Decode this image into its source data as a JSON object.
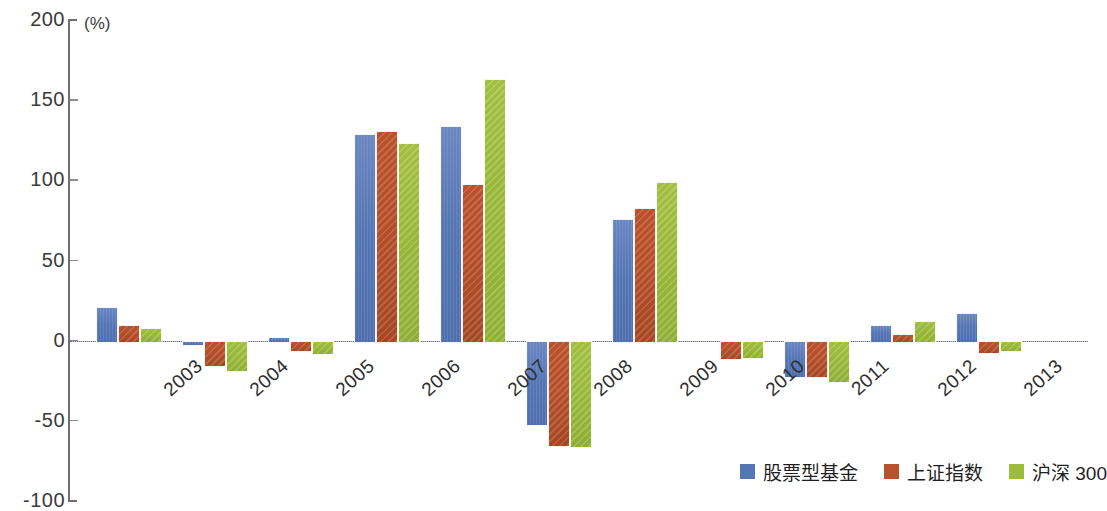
{
  "chart_data": {
    "type": "bar",
    "title": "",
    "subtitle": "",
    "xlabel": "",
    "ylabel": "",
    "unit_label": "(%)",
    "ylim": [
      -100,
      200
    ],
    "yticks": [
      200,
      150,
      100,
      50,
      0,
      -50,
      -100
    ],
    "ytick_labels": [
      "200",
      "150",
      "100",
      "50",
      "0",
      "-50",
      "-100"
    ],
    "grid": false,
    "legend_position": "bottom-right",
    "categories": [
      "2003",
      "2004",
      "2005",
      "2006",
      "2007",
      "2008",
      "2009",
      "2010",
      "2011",
      "2012",
      "2013"
    ],
    "series": [
      {
        "name": "股票型基金",
        "color": "#5576b4",
        "values": [
          21,
          -2,
          2,
          129,
          134,
          -52,
          76,
          0,
          -22,
          10,
          17
        ]
      },
      {
        "name": "上证指数",
        "color": "#b9512b",
        "values": [
          10,
          -15,
          -6,
          131,
          98,
          -65,
          83,
          -11,
          -22,
          4,
          -7
        ]
      },
      {
        "name": "沪深 300",
        "color": "#9cbc3c",
        "values": [
          8,
          -18,
          -8,
          123,
          163,
          -66,
          99,
          -10,
          -25,
          12,
          -6
        ]
      }
    ]
  },
  "legend": {
    "items": [
      {
        "label": "股票型基金",
        "color": "#5576b4",
        "swatch_name": "legend-swatch-blue"
      },
      {
        "label": "上证指数",
        "color": "#b9512b",
        "swatch_name": "legend-swatch-orange"
      },
      {
        "label": "沪深 300",
        "color": "#9cbc3c",
        "swatch_name": "legend-swatch-green"
      }
    ]
  }
}
